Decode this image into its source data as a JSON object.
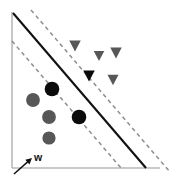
{
  "figure": {
    "width": 172,
    "height": 182,
    "background": "#ffffff"
  },
  "labels": {
    "weight_vector": "w"
  },
  "colors": {
    "axis": "#b9b9b9",
    "decision_boundary": "#111111",
    "margin_line": "#8e8e8e",
    "point_plain": "#575757",
    "point_support_vector": "#0b0b0b",
    "background": "#ffffff"
  },
  "chart_data": {
    "type": "scatter",
    "title": "",
    "subtitle": "",
    "xlabel": "",
    "ylabel": "",
    "xlim": [
      0,
      172
    ],
    "ylim": [
      182,
      0
    ],
    "grid": false,
    "legend": false,
    "annotations": [
      {
        "name": "weight-vector-label",
        "text": "w",
        "x": 34,
        "y": 161,
        "arrow_from": [
          14,
          174
        ],
        "arrow_to": [
          32,
          158
        ]
      }
    ],
    "axes": {
      "y_axis": {
        "x1": 12,
        "y1": 12,
        "x2": 12,
        "y2": 168
      },
      "x_axis": {
        "x1": 12,
        "y1": 168,
        "x2": 160,
        "y2": 168
      }
    },
    "lines": [
      {
        "name": "decision-boundary",
        "style": "solid",
        "color": "#111111",
        "width": 2.1,
        "x1": 13,
        "y1": 13,
        "x2": 146,
        "y2": 168
      },
      {
        "name": "upper-margin",
        "style": "dashed",
        "color": "#8e8e8e",
        "width": 1.5,
        "x1": 31,
        "y1": 10,
        "x2": 170,
        "y2": 172
      },
      {
        "name": "lower-margin",
        "style": "dashed",
        "color": "#8e8e8e",
        "width": 1.5,
        "x1": 12,
        "y1": 41,
        "x2": 121,
        "y2": 168
      }
    ],
    "series": [
      {
        "name": "Class A (circles)",
        "marker": "circle",
        "count": 5,
        "points": [
          {
            "x": 52,
            "y": 89,
            "r": 7.3,
            "support_vector": true,
            "color": "#0b0b0b"
          },
          {
            "x": 33,
            "y": 100,
            "r": 6.9,
            "support_vector": false,
            "color": "#575757"
          },
          {
            "x": 49,
            "y": 117,
            "r": 6.9,
            "support_vector": false,
            "color": "#575757"
          },
          {
            "x": 79,
            "y": 117,
            "r": 7.3,
            "support_vector": true,
            "color": "#0b0b0b"
          },
          {
            "x": 49,
            "y": 138,
            "r": 6.6,
            "support_vector": false,
            "color": "#575757"
          }
        ]
      },
      {
        "name": "Class B (triangles)",
        "marker": "triangle-down",
        "count": 5,
        "points": [
          {
            "x": 75,
            "y": 46,
            "size": 11.5,
            "support_vector": false,
            "color": "#575757"
          },
          {
            "x": 99,
            "y": 56,
            "size": 10.5,
            "support_vector": false,
            "color": "#575757"
          },
          {
            "x": 116,
            "y": 53,
            "size": 11.5,
            "support_vector": false,
            "color": "#575757"
          },
          {
            "x": 89,
            "y": 76,
            "size": 11.5,
            "support_vector": true,
            "color": "#0b0b0b"
          },
          {
            "x": 113,
            "y": 80,
            "size": 11.0,
            "support_vector": false,
            "color": "#575757"
          }
        ]
      }
    ]
  }
}
